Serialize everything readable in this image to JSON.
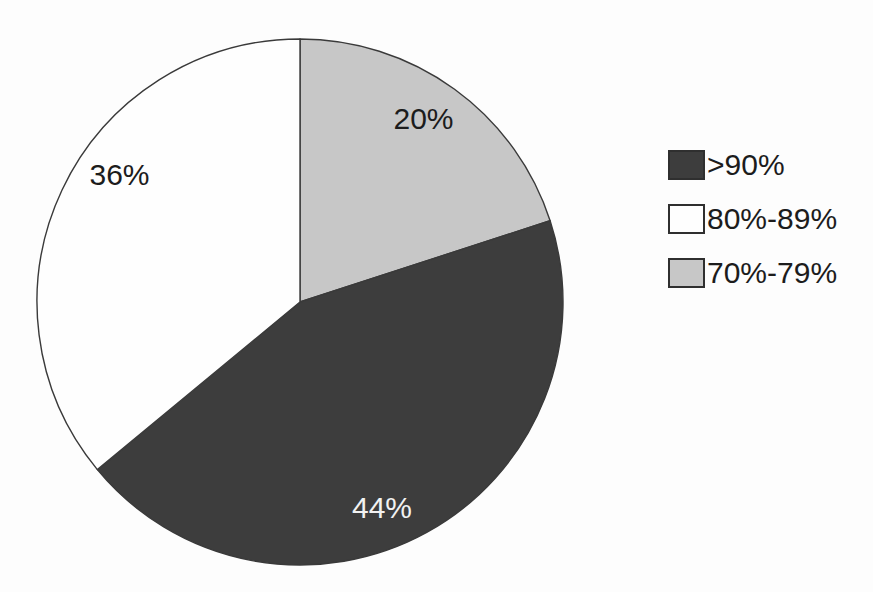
{
  "chart_data": {
    "type": "pie",
    "title": "",
    "legend_position": "right",
    "start_angle_deg": 0,
    "direction": "clockwise",
    "background_color": "#fdfdfd",
    "outline_color": "#3a3a3a",
    "slices": [
      {
        "label": ">90%",
        "value": 44,
        "data_label": "44%",
        "color": "#3d3d3d",
        "text_color": "#f2f2f2"
      },
      {
        "label": "80%-89%",
        "value": 36,
        "data_label": "36%",
        "color": "#fefefe",
        "text_color": "#1c1c1c"
      },
      {
        "label": "70%-79%",
        "value": 20,
        "data_label": "20%",
        "color": "#c7c7c7",
        "text_color": "#1c1c1c"
      }
    ],
    "draw_order_from_top": [
      "70%-79%",
      ">90%",
      "80%-89%"
    ]
  }
}
